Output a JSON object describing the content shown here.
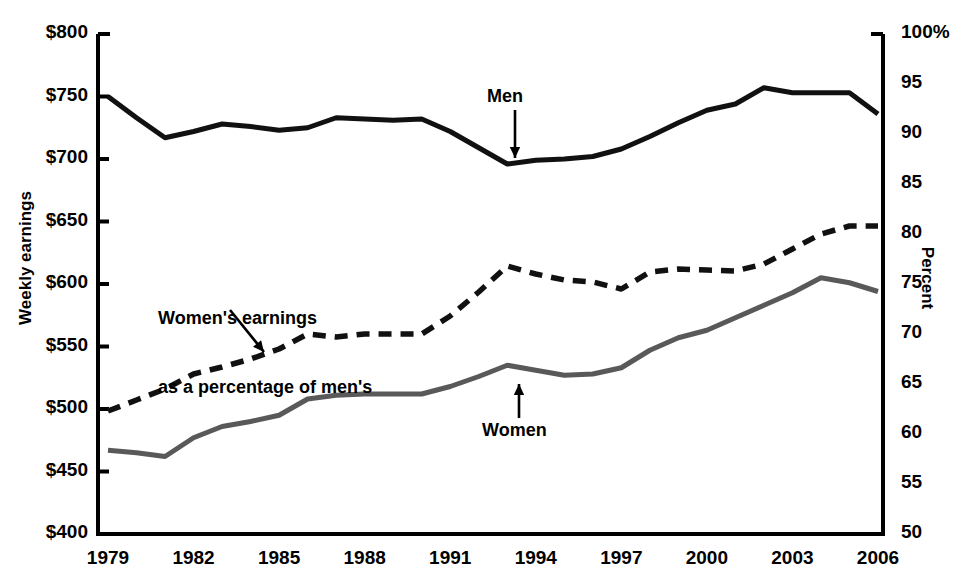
{
  "chart_data": {
    "type": "line",
    "title": "",
    "xlabel": "",
    "ylabel": "Weekly earnings",
    "ylabel_right": "Percent",
    "x": [
      1979,
      1980,
      1981,
      1982,
      1983,
      1984,
      1985,
      1986,
      1987,
      1988,
      1989,
      1990,
      1991,
      1992,
      1993,
      1994,
      1995,
      1996,
      1997,
      1998,
      1999,
      2000,
      2001,
      2002,
      2003,
      2004,
      2005,
      2006
    ],
    "xtick_labels": [
      "1979",
      "1982",
      "1985",
      "1988",
      "1991",
      "1994",
      "1997",
      "2000",
      "2003",
      "2006"
    ],
    "xtick_values": [
      1979,
      1982,
      1985,
      1988,
      1991,
      1994,
      1997,
      2000,
      2003,
      2006
    ],
    "xlim": [
      1979,
      2006
    ],
    "ylim": [
      400,
      800
    ],
    "ytick_labels": [
      "$800",
      "$750",
      "$700",
      "$650",
      "$600",
      "$550",
      "$500",
      "$450",
      "$400"
    ],
    "ytick_values": [
      800,
      750,
      700,
      650,
      600,
      550,
      500,
      450,
      400
    ],
    "ylim_right": [
      50,
      100
    ],
    "ytick_labels_right": [
      "100%",
      "95",
      "90",
      "85",
      "80",
      "75",
      "70",
      "65",
      "60",
      "55",
      "50"
    ],
    "ytick_values_right": [
      100,
      95,
      90,
      85,
      80,
      75,
      70,
      65,
      60,
      55,
      50
    ],
    "grid": false,
    "legend": "annotations-on-plot",
    "series": [
      {
        "name": "Men",
        "axis": "left",
        "style": "solid",
        "color": "#111111",
        "width": 5,
        "values": [
          750,
          733,
          717,
          722,
          728,
          726,
          723,
          725,
          733,
          732,
          731,
          732,
          722,
          709,
          696,
          699,
          700,
          702,
          708,
          718,
          729,
          739,
          744,
          757,
          753,
          753,
          753,
          736
        ]
      },
      {
        "name": "Women",
        "axis": "left",
        "style": "solid",
        "color": "#595959",
        "width": 5,
        "values": [
          467,
          465,
          462,
          477,
          486,
          490,
          495,
          508,
          511,
          512,
          512,
          512,
          518,
          526,
          535,
          531,
          527,
          528,
          533,
          547,
          557,
          563,
          573,
          583,
          593,
          605,
          601,
          594
        ]
      },
      {
        "name": "Women's earnings as a percentage of men's",
        "axis": "right",
        "style": "dashed",
        "color": "#111111",
        "width": 5.5,
        "values": [
          62.3,
          63.4,
          64.5,
          66.0,
          66.7,
          67.5,
          68.5,
          70.0,
          69.7,
          70.0,
          70.0,
          70.0,
          71.8,
          74.2,
          76.8,
          76.0,
          75.4,
          75.2,
          74.5,
          76.2,
          76.5,
          76.4,
          76.3,
          77.0,
          78.5,
          80.0,
          80.8,
          80.8
        ]
      }
    ],
    "annotations": [
      {
        "id": "men",
        "text": "Men",
        "arrow": "down",
        "points_to_year": 1993
      },
      {
        "id": "women",
        "text": "Women",
        "arrow": "up",
        "points_to_year": 1993
      },
      {
        "id": "pct",
        "text": "Women's earnings\nas a percentage of men's",
        "arrow": "diagonal-down-right",
        "points_to_year": 1987
      }
    ]
  },
  "axes": {
    "left_title": "Weekly earnings",
    "right_title": "Percent"
  },
  "annotations": {
    "men_label": "Men",
    "women_label": "Women",
    "percent_label_line1": "Women's earnings",
    "percent_label_line2": "as a percentage of men's"
  },
  "colors": {
    "men_line": "#111111",
    "women_line": "#595959",
    "percent_line": "#111111",
    "axis": "#000000",
    "background": "#ffffff"
  }
}
